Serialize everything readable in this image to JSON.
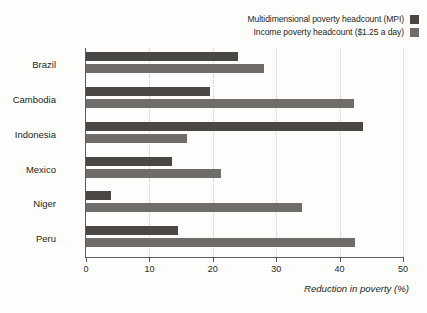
{
  "chart_data": {
    "type": "bar",
    "orientation": "horizontal",
    "title": "",
    "xlabel": "Reduction in poverty (%)",
    "ylabel": "",
    "xlim": [
      0,
      50
    ],
    "xticks": [
      0,
      10,
      20,
      30,
      40,
      50
    ],
    "grid": true,
    "legend_position": "top-right",
    "categories": [
      "Brazil",
      "Cambodia",
      "Indonesia",
      "Mexico",
      "Niger",
      "Peru"
    ],
    "series": [
      {
        "name": "Multidimensional poverty headcount (MPI)",
        "color": "#4a4745",
        "values": [
          24,
          19.5,
          43.7,
          13.5,
          4,
          14.5
        ]
      },
      {
        "name": "Income poverty headcount ($1.25 a day)",
        "color": "#6f6c69",
        "values": [
          28,
          42.3,
          16,
          21.3,
          34,
          42.5
        ]
      }
    ]
  },
  "legend": {
    "items": [
      {
        "label": "Multidimensional poverty headcount (MPI)",
        "color": "#4a4745"
      },
      {
        "label": "Income poverty headcount ($1.25 a day)",
        "color": "#6f6c69"
      }
    ]
  },
  "axis": {
    "x_title": "Reduction in poverty (%)",
    "tick_labels": [
      "0",
      "10",
      "20",
      "30",
      "40",
      "50"
    ]
  }
}
